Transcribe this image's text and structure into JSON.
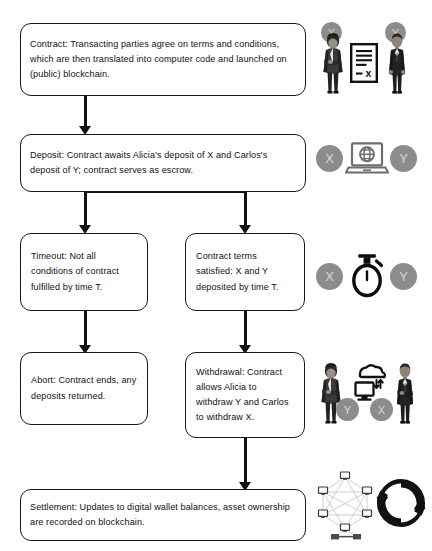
{
  "diagram": {
    "type": "flowchart",
    "colors": {
      "node_border": "#1a1a1a",
      "node_fill": "#ffffff",
      "text": "#111111",
      "connector": "#111111",
      "badge_fill": "#8c8c8c",
      "badge_text": "#d8d8d8"
    },
    "nodes": [
      {
        "id": "contract",
        "label": "Contract",
        "text": "Contract: Transacting parties agree on terms and conditions, which are then translated into computer code and launched on (public) blockchain."
      },
      {
        "id": "deposit",
        "label": "Deposit",
        "text": "Deposit: Contract awaits Alicia's deposit of X and Carlos's deposit of Y; contract serves as escrow."
      },
      {
        "id": "timeout",
        "label": "Timeout",
        "text": "Timeout: Not all conditions of contract fulfilled by time T."
      },
      {
        "id": "terms-satisfied",
        "label": "Contract terms satisfied",
        "text": "Contract terms satisfied: X and Y deposited by time T."
      },
      {
        "id": "abort",
        "label": "Abort",
        "text": "Abort: Contract ends, any deposits returned."
      },
      {
        "id": "withdrawal",
        "label": "Withdrawal",
        "text": "Withdrawal: Contract allows Alicia to withdraw Y and Carlos to withdraw X."
      },
      {
        "id": "settlement",
        "label": "Settlement",
        "text": "Settlement: Updates to digital wallet balances, asset ownership are recorded on blockchain."
      }
    ],
    "edges": [
      {
        "from": "contract",
        "to": "deposit"
      },
      {
        "from": "deposit",
        "to": "timeout"
      },
      {
        "from": "deposit",
        "to": "terms-satisfied"
      },
      {
        "from": "timeout",
        "to": "abort"
      },
      {
        "from": "terms-satisfied",
        "to": "withdrawal"
      },
      {
        "from": "withdrawal",
        "to": "settlement"
      }
    ],
    "icon_groups": [
      {
        "id": "contract-icons",
        "for_node": "contract",
        "icons": [
          "businesswoman-icon",
          "contract-document-icon",
          "businessman-icon"
        ],
        "badges": [
          "X",
          "Y"
        ]
      },
      {
        "id": "deposit-icons",
        "for_node": "deposit",
        "icons": [
          "laptop-globe-icon"
        ],
        "badges": [
          "X",
          "Y"
        ]
      },
      {
        "id": "timeout-icons",
        "for_node": "terms-satisfied",
        "icons": [
          "stopwatch-icon"
        ],
        "badges": [
          "X",
          "Y"
        ]
      },
      {
        "id": "withdrawal-icons",
        "for_node": "withdrawal",
        "icons": [
          "businesswoman-icon",
          "cloud-exchange-icon",
          "businessman-icon"
        ],
        "badges": [
          "Y",
          "X"
        ]
      },
      {
        "id": "settlement-icons",
        "for_node": "settlement",
        "icons": [
          "network-mesh-icon",
          "sync-arrows-icon"
        ],
        "badges": []
      }
    ]
  }
}
